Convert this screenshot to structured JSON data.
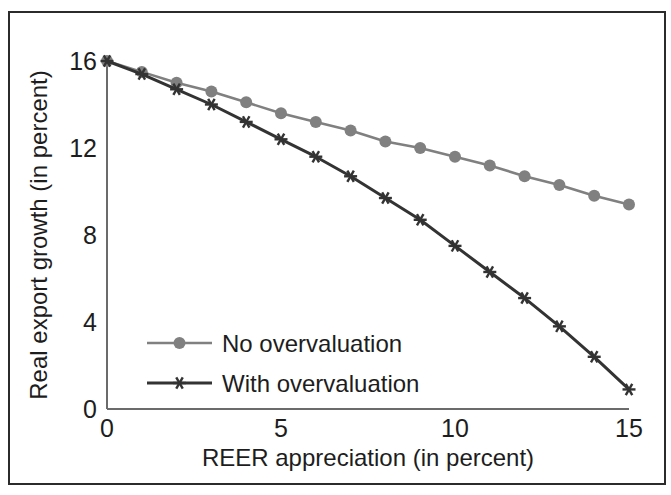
{
  "chart_data": {
    "type": "line",
    "title": "",
    "xlabel": "REER appreciation (in percent)",
    "ylabel": "Real export growth (in percent)",
    "xlim": [
      0,
      15
    ],
    "ylim": [
      0,
      16
    ],
    "xticks": [
      0,
      5,
      10,
      15
    ],
    "yticks": [
      0,
      4,
      8,
      12,
      16
    ],
    "xtick_labels": [
      "0",
      "5",
      "10",
      "15"
    ],
    "ytick_labels": [
      "0",
      "4",
      "8",
      "12",
      "16"
    ],
    "grid": false,
    "legend_position": "lower-left-inside",
    "x": [
      0,
      1,
      2,
      3,
      4,
      5,
      6,
      7,
      8,
      9,
      10,
      11,
      12,
      13,
      14,
      15
    ],
    "series": [
      {
        "name": "No overvaluation",
        "color": "#808080",
        "marker": "circle",
        "values": [
          16.0,
          15.5,
          15.0,
          14.6,
          14.1,
          13.6,
          13.2,
          12.8,
          12.3,
          12.0,
          11.6,
          11.2,
          10.7,
          10.3,
          9.8,
          9.4
        ]
      },
      {
        "name": "With overvaluation",
        "color": "#333333",
        "marker": "star",
        "values": [
          16.0,
          15.4,
          14.7,
          14.0,
          13.2,
          12.4,
          11.6,
          10.7,
          9.7,
          8.7,
          7.5,
          6.3,
          5.1,
          3.8,
          2.4,
          0.9
        ]
      }
    ]
  },
  "axes": {
    "x_title": "REER appreciation (in percent)",
    "y_title": "Real export growth (in percent)",
    "x_tick_labels": [
      "0",
      "5",
      "10",
      "15"
    ],
    "y_tick_labels": [
      "0",
      "4",
      "8",
      "12",
      "16"
    ]
  },
  "legend": {
    "items": [
      {
        "label": "No overvaluation",
        "color": "#808080",
        "marker": "circle"
      },
      {
        "label": "With overvaluation",
        "color": "#333333",
        "marker": "star"
      }
    ]
  },
  "colors": {
    "frame": "#2b2b2b",
    "axis": "#6b6b6b",
    "text": "#1d1d1d",
    "series_light": "#808080",
    "series_dark": "#333333",
    "background": "#ffffff"
  }
}
